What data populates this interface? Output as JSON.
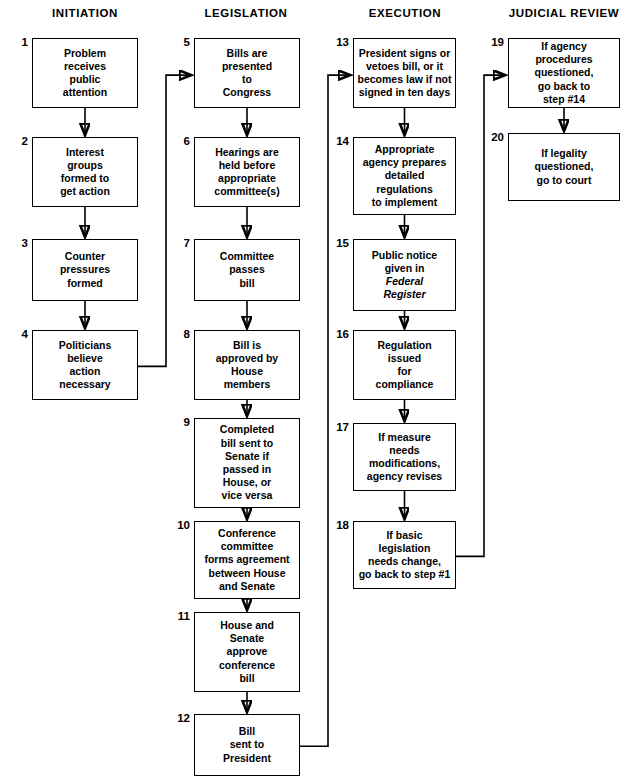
{
  "diagram": {
    "columns": [
      {
        "id": "initiation",
        "label": "INITIATION",
        "center_x": 85
      },
      {
        "id": "legislation",
        "label": "LEGISLATION",
        "center_x": 246
      },
      {
        "id": "execution",
        "label": "EXECUTION",
        "center_x": 405
      },
      {
        "id": "judicial_review",
        "label": "JUDICIAL REVIEW",
        "center_x": 564
      }
    ],
    "nodes": [
      {
        "num": "1",
        "column": "initiation",
        "text": "Problem\nreceives\npublic\nattention",
        "x": 32,
        "y": 38,
        "w": 106,
        "h": 70
      },
      {
        "num": "2",
        "column": "initiation",
        "text": "Interest\ngroups\nformed to\nget action",
        "x": 32,
        "y": 137,
        "w": 106,
        "h": 70
      },
      {
        "num": "3",
        "column": "initiation",
        "text": "Counter\npressures\nformed",
        "x": 32,
        "y": 239,
        "w": 106,
        "h": 62
      },
      {
        "num": "4",
        "column": "initiation",
        "text": "Politicians\nbelieve\naction\nnecessary",
        "x": 32,
        "y": 330,
        "w": 106,
        "h": 70
      },
      {
        "num": "5",
        "column": "legislation",
        "text": "Bills are\npresented\nto\nCongress",
        "x": 194,
        "y": 38,
        "w": 106,
        "h": 70
      },
      {
        "num": "6",
        "column": "legislation",
        "text": "Hearings are\nheld before\nappropriate\ncommittee(s)",
        "x": 194,
        "y": 137,
        "w": 106,
        "h": 70
      },
      {
        "num": "7",
        "column": "legislation",
        "text": "Committee\npasses\nbill",
        "x": 194,
        "y": 239,
        "w": 106,
        "h": 62
      },
      {
        "num": "8",
        "column": "legislation",
        "text": "Bill is\napproved by\nHouse\nmembers",
        "x": 194,
        "y": 330,
        "w": 106,
        "h": 70
      },
      {
        "num": "9",
        "column": "legislation",
        "text": "Completed\nbill sent to\nSenate if\npassed in\nHouse, or\nvice versa",
        "x": 194,
        "y": 418,
        "w": 106,
        "h": 90
      },
      {
        "num": "10",
        "column": "legislation",
        "text": "Conference\ncommittee\nforms agreement\nbetween House\nand Senate",
        "x": 194,
        "y": 521,
        "w": 106,
        "h": 78
      },
      {
        "num": "11",
        "column": "legislation",
        "text": "House and\nSenate\napprove\nconference\nbill",
        "x": 194,
        "y": 612,
        "w": 106,
        "h": 80
      },
      {
        "num": "12",
        "column": "legislation",
        "text": "Bill\nsent to\nPresident",
        "x": 194,
        "y": 714,
        "w": 106,
        "h": 62
      },
      {
        "num": "13",
        "column": "execution",
        "text": "President signs or\nvetoes bill, or it\nbecomes law if not\nsigned in ten days",
        "x": 353,
        "y": 38,
        "w": 103,
        "h": 70
      },
      {
        "num": "14",
        "column": "execution",
        "text": "Appropriate\nagency prepares\ndetailed\nregulations\nto implement",
        "x": 353,
        "y": 137,
        "w": 103,
        "h": 78
      },
      {
        "num": "15",
        "column": "execution",
        "text": "Public notice\ngiven in\n__Federal__\n__Register__",
        "x": 353,
        "y": 239,
        "w": 103,
        "h": 72
      },
      {
        "num": "16",
        "column": "execution",
        "text": "Regulation\nissued\nfor\ncompliance",
        "x": 353,
        "y": 330,
        "w": 103,
        "h": 70
      },
      {
        "num": "17",
        "column": "execution",
        "text": "If measure\nneeds\nmodifications,\nagency revises",
        "x": 353,
        "y": 423,
        "w": 103,
        "h": 68
      },
      {
        "num": "18",
        "column": "execution",
        "text": "If basic\nlegislation\nneeds change,\ngo back to step #1",
        "x": 353,
        "y": 521,
        "w": 103,
        "h": 68
      },
      {
        "num": "19",
        "column": "judicial_review",
        "text": "If agency\nprocedures\nquestioned,\ngo back to\nstep #14",
        "x": 508,
        "y": 38,
        "w": 112,
        "h": 70
      },
      {
        "num": "20",
        "column": "judicial_review",
        "text": "If legality\nquestioned,\ngo to court",
        "x": 508,
        "y": 133,
        "w": 112,
        "h": 68
      }
    ],
    "edges": [
      {
        "from": "1",
        "to": "2",
        "kind": "straight-down"
      },
      {
        "from": "2",
        "to": "3",
        "kind": "straight-down"
      },
      {
        "from": "3",
        "to": "4",
        "kind": "straight-down"
      },
      {
        "from": "4",
        "to": "5",
        "kind": "right-up-right"
      },
      {
        "from": "5",
        "to": "6",
        "kind": "straight-down"
      },
      {
        "from": "6",
        "to": "7",
        "kind": "straight-down"
      },
      {
        "from": "7",
        "to": "8",
        "kind": "straight-down"
      },
      {
        "from": "8",
        "to": "9",
        "kind": "straight-down"
      },
      {
        "from": "9",
        "to": "10",
        "kind": "straight-down"
      },
      {
        "from": "10",
        "to": "11",
        "kind": "straight-down"
      },
      {
        "from": "11",
        "to": "12",
        "kind": "straight-down"
      },
      {
        "from": "12",
        "to": "13",
        "kind": "right-up-right"
      },
      {
        "from": "13",
        "to": "14",
        "kind": "straight-down"
      },
      {
        "from": "14",
        "to": "15",
        "kind": "straight-down"
      },
      {
        "from": "15",
        "to": "16",
        "kind": "straight-down"
      },
      {
        "from": "16",
        "to": "17",
        "kind": "straight-down"
      },
      {
        "from": "17",
        "to": "18",
        "kind": "straight-down"
      },
      {
        "from": "18",
        "to": "19",
        "kind": "right-up-right"
      },
      {
        "from": "19",
        "to": "20",
        "kind": "straight-down"
      }
    ],
    "colors": {
      "stroke": "#000000",
      "background": "#ffffff",
      "text": "#000000"
    }
  }
}
